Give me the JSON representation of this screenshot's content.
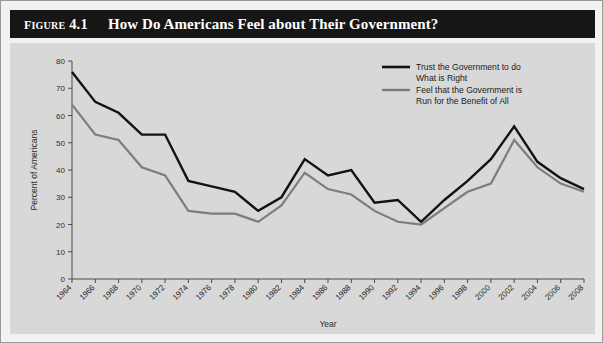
{
  "figure": {
    "number_label": "Figure 4.1",
    "title": "How Do Americans Feel about Their Government?"
  },
  "colors": {
    "banner_background": "#161616",
    "banner_text": "#ffffff",
    "plot_background": "#d8d8d8",
    "page_background": "#f2f2f2",
    "series_trust": "#121212",
    "series_benefit": "#7d7d7d",
    "axis": "#4a4a4a"
  },
  "chart_data": {
    "type": "line",
    "title": "How Do Americans Feel about Their Government?",
    "xlabel": "Year",
    "ylabel": "Percent of Americans",
    "ylim": [
      0,
      80
    ],
    "ytick_step": 10,
    "yticks": [
      0,
      10,
      20,
      30,
      40,
      50,
      60,
      70,
      80
    ],
    "grid": false,
    "legend_position": "top-right-inside",
    "x": [
      1964,
      1966,
      1968,
      1970,
      1972,
      1974,
      1976,
      1978,
      1980,
      1982,
      1984,
      1986,
      1988,
      1990,
      1992,
      1994,
      1996,
      1998,
      2000,
      2002,
      2004,
      2006,
      2008
    ],
    "xtick_labels": [
      "1964",
      "1966",
      "1968",
      "1970",
      "1972",
      "1974",
      "1976",
      "1978",
      "1980",
      "1982",
      "1984",
      "1986",
      "1988",
      "1990",
      "1992",
      "1994",
      "1996",
      "1998",
      "2000",
      "2002",
      "2004",
      "2006",
      "2008"
    ],
    "series": [
      {
        "name": "Trust the Government to do What is Right",
        "legend_line1": "Trust the Government to do",
        "legend_line2": "What is Right",
        "color": "#121212",
        "values": [
          76,
          65,
          61,
          53,
          53,
          36,
          34,
          32,
          25,
          30,
          44,
          38,
          40,
          28,
          29,
          21,
          29,
          36,
          44,
          56,
          43,
          37,
          33
        ]
      },
      {
        "name": "Feel that the Government is Run for the Benefit of All",
        "legend_line1": "Feel that the Government is",
        "legend_line2": "Run for the Benefit of All",
        "color": "#7d7d7d",
        "values": [
          64,
          53,
          51,
          41,
          38,
          25,
          24,
          24,
          21,
          27,
          39,
          33,
          31,
          25,
          21,
          20,
          26,
          32,
          35,
          51,
          41,
          35,
          32
        ]
      }
    ]
  }
}
